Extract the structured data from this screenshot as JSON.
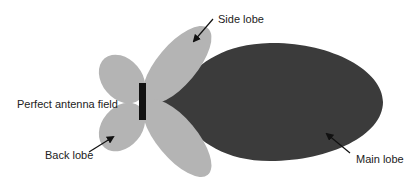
{
  "diagram": {
    "labels": {
      "side_lobe": "Side lobe",
      "perfect_antenna_field": "Perfect antenna field",
      "back_lobe": "Back lobe",
      "main_lobe": "Main lobe"
    },
    "colors": {
      "background": "#ffffff",
      "minor_lobe_fill": "#b4b4b4",
      "main_lobe_fill": "#3b3b3b",
      "antenna": "#111111",
      "text": "#222222",
      "arrow": "#111111"
    }
  }
}
